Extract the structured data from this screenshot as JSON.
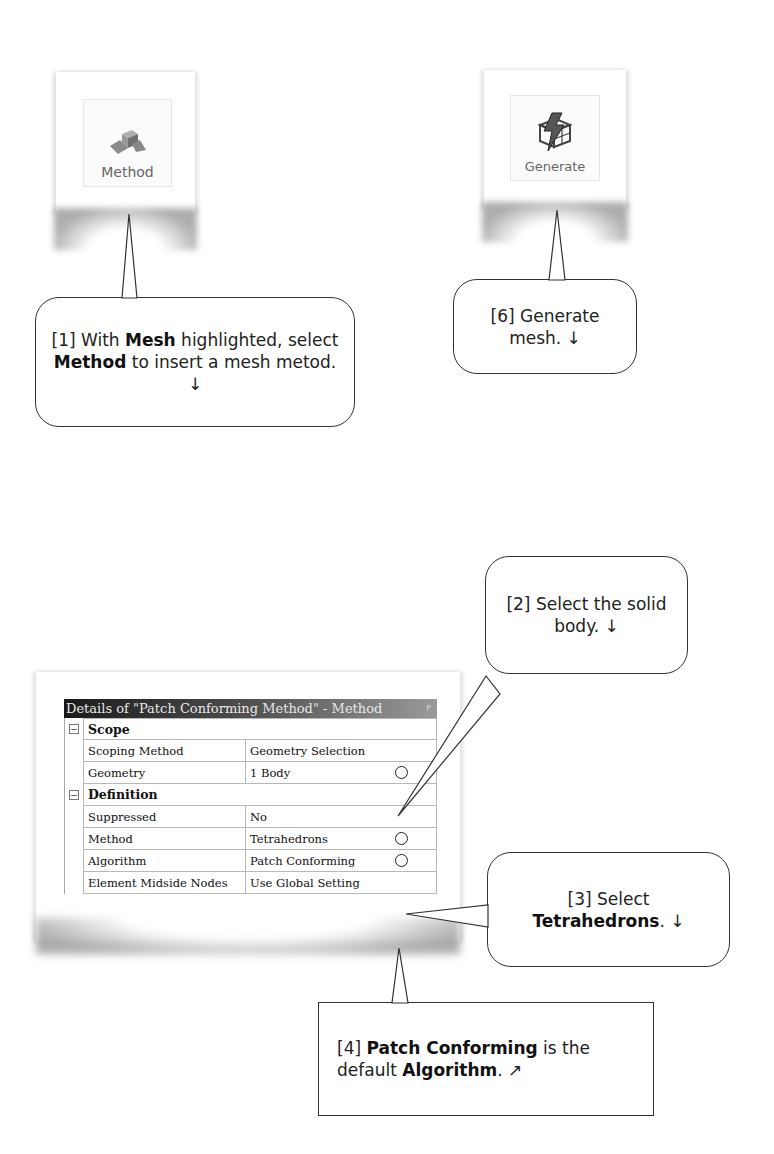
{
  "ribbon": {
    "method_button": {
      "label": "Method",
      "icon": "method-blocks-icon"
    },
    "generate_button": {
      "label": "Generate",
      "icon": "generate-lightning-mesh-icon"
    }
  },
  "callouts": {
    "step1": {
      "prefix": "[1] With ",
      "b1": "Mesh",
      "mid1": " highlighted, select ",
      "b2": "Method",
      "mid2": " to insert a mesh metod. ",
      "arrow": "↓"
    },
    "step2": {
      "text": "[2] Select the solid body. ",
      "arrow": "↓"
    },
    "step3": {
      "prefix": "[3] Select ",
      "b1": "Tetrahedrons",
      "suffix": ". ",
      "arrow": "↓"
    },
    "step4": {
      "prefix": "[4] ",
      "b1": "Patch Conforming",
      "mid1": " is the default ",
      "b2": "Algorithm",
      "suffix": ". ",
      "arrow": "↗"
    },
    "step6": {
      "text": "[6] Generate mesh. ",
      "arrow": "↓"
    }
  },
  "details": {
    "title": "Details of \"Patch Conforming Method\" - Method",
    "pin_icon": "pin-icon",
    "sections": [
      {
        "name": "Scope",
        "toggle": "−",
        "rows": [
          {
            "name": "Scoping Method",
            "value": "Geometry Selection"
          },
          {
            "name": "Geometry",
            "value": "1 Body"
          }
        ]
      },
      {
        "name": "Definition",
        "toggle": "−",
        "rows": [
          {
            "name": "Suppressed",
            "value": "No"
          },
          {
            "name": "Method",
            "value": "Tetrahedrons"
          },
          {
            "name": "Algorithm",
            "value": "Patch Conforming"
          },
          {
            "name": "Element Midside Nodes",
            "value": "Use Global Setting"
          }
        ]
      }
    ]
  }
}
